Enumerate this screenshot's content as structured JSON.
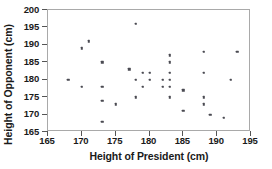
{
  "chart_data": {
    "type": "scatter",
    "title": "",
    "xlabel": "Height of President (cm)",
    "ylabel": "Height of Opponent (cm)",
    "xlim": [
      165,
      195
    ],
    "ylim": [
      165,
      200
    ],
    "xticks": [
      165,
      170,
      175,
      180,
      185,
      190,
      195
    ],
    "yticks": [
      165,
      170,
      175,
      180,
      185,
      190,
      195,
      200
    ],
    "grid": false,
    "legend": null,
    "marker_color": "#4a4a52",
    "frame_color": "#a9a9a9",
    "points": [
      {
        "x": 168,
        "y": 180
      },
      {
        "x": 170,
        "y": 189
      },
      {
        "x": 170,
        "y": 178
      },
      {
        "x": 171,
        "y": 191
      },
      {
        "x": 173,
        "y": 185
      },
      {
        "x": 173,
        "y": 178
      },
      {
        "x": 173,
        "y": 174
      },
      {
        "x": 173,
        "y": 168
      },
      {
        "x": 175,
        "y": 173
      },
      {
        "x": 177,
        "y": 183
      },
      {
        "x": 178,
        "y": 196
      },
      {
        "x": 178,
        "y": 180
      },
      {
        "x": 178,
        "y": 175
      },
      {
        "x": 179,
        "y": 182
      },
      {
        "x": 179,
        "y": 178
      },
      {
        "x": 180,
        "y": 180
      },
      {
        "x": 180,
        "y": 182
      },
      {
        "x": 182,
        "y": 180
      },
      {
        "x": 182,
        "y": 178
      },
      {
        "x": 183,
        "y": 187
      },
      {
        "x": 183,
        "y": 185
      },
      {
        "x": 183,
        "y": 182
      },
      {
        "x": 183,
        "y": 180
      },
      {
        "x": 183,
        "y": 178
      },
      {
        "x": 183,
        "y": 175
      },
      {
        "x": 185,
        "y": 177
      },
      {
        "x": 185,
        "y": 171
      },
      {
        "x": 188,
        "y": 188
      },
      {
        "x": 188,
        "y": 182
      },
      {
        "x": 188,
        "y": 175
      },
      {
        "x": 188,
        "y": 173
      },
      {
        "x": 189,
        "y": 170
      },
      {
        "x": 191,
        "y": 169
      },
      {
        "x": 192,
        "y": 180
      },
      {
        "x": 193,
        "y": 188
      }
    ]
  }
}
